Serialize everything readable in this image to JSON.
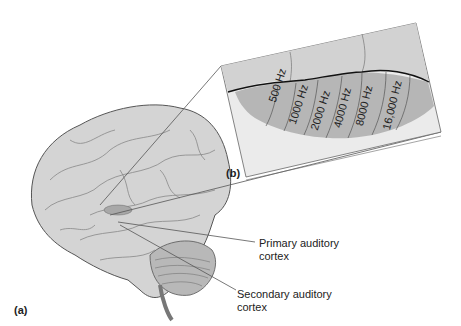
{
  "figure": {
    "panel_a_label": "(a)",
    "panel_b_label": "(b)",
    "labels": {
      "primary_line1": "Primary auditory",
      "primary_line2": "cortex",
      "secondary_line1": "Secondary auditory",
      "secondary_line2": "cortex"
    },
    "frequencies": [
      "500 Hz",
      "1000 Hz",
      "2000 Hz",
      "4000 Hz",
      "8000 Hz",
      "16,000 Hz"
    ],
    "colors": {
      "panel_bg": "#e6e6e6",
      "upper_band": "#d0d0d0",
      "cortex_region": "#b4b4b4",
      "brain": "#cfcfcf",
      "line": "#555555"
    }
  }
}
